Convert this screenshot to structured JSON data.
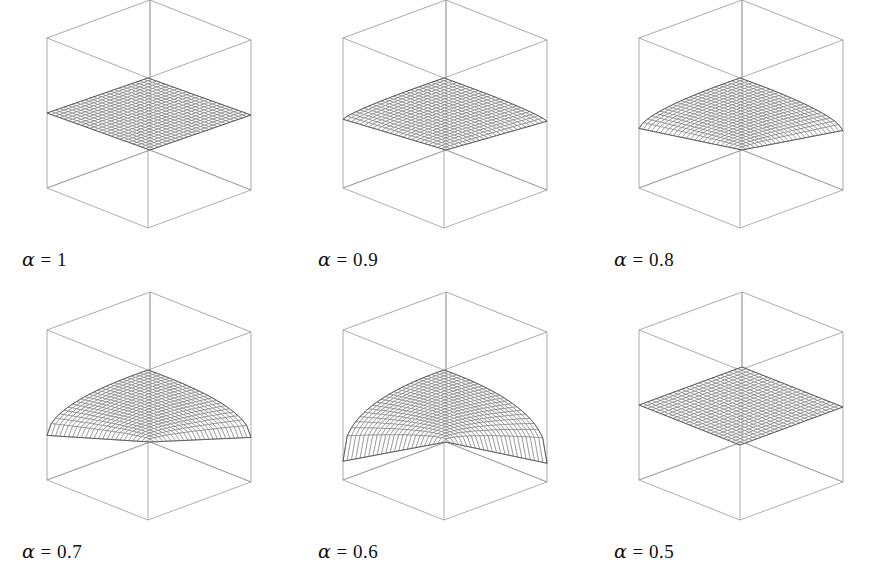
{
  "figure": {
    "title": "",
    "background": "#ffffff",
    "line_color": "#6f6f6f",
    "box_color": "#8a8a8a",
    "text_color": "#111111",
    "rows": 2,
    "cols": 3
  },
  "panels": [
    {
      "id": "panel-alpha-1",
      "alpha_symbol": "α",
      "equals": "=",
      "value": "1",
      "label": "α = 1"
    },
    {
      "id": "panel-alpha-0-9",
      "alpha_symbol": "α",
      "equals": "=",
      "value": "0.9",
      "label": "α = 0.9"
    },
    {
      "id": "panel-alpha-0-8",
      "alpha_symbol": "α",
      "equals": "=",
      "value": "0.8",
      "label": "α = 0.8"
    },
    {
      "id": "panel-alpha-0-7",
      "alpha_symbol": "α",
      "equals": "=",
      "value": "0.7",
      "label": "α = 0.7"
    },
    {
      "id": "panel-alpha-0-6",
      "alpha_symbol": "α",
      "equals": "=",
      "value": "0.6",
      "label": "α = 0.6"
    },
    {
      "id": "panel-alpha-0-5",
      "alpha_symbol": "α",
      "equals": "=",
      "value": "0.5",
      "label": "α = 0.5"
    }
  ],
  "chart_data": {
    "type": "line",
    "subtype": "3d-wireframe-surface-grid",
    "title": "",
    "xlabel": "",
    "ylabel": "",
    "zlabel": "",
    "grid": false,
    "legend": "none",
    "axis_ranges": {
      "x": [
        0,
        1
      ],
      "y": [
        0,
        1
      ],
      "z": [
        0,
        1
      ]
    },
    "mesh_resolution": {
      "nx": 24,
      "ny": 24
    },
    "surface_formula": "z = ((x^p + y^p)/2)^(1/p), p = (2*alpha - 1)/alpha",
    "panels": [
      {
        "label": "α = 1",
        "alpha": 1,
        "p": 1,
        "description": "pyramid / peaked tent surface, apex at centre back, value 1 at peak",
        "peak_z": 1.0,
        "corner_z": {
          "front": 0.0,
          "left": 0.5,
          "right": 0.5,
          "back": 1.0
        }
      },
      {
        "label": "α = 0.9",
        "alpha": 0.9,
        "p": 0.888888,
        "description": "rounded peak, sides slightly convex",
        "peak_z": 1.0,
        "corner_z": {
          "front": 0.0,
          "left": 0.5,
          "right": 0.5,
          "back": 1.0
        }
      },
      {
        "label": "α = 0.8",
        "alpha": 0.8,
        "p": 0.75,
        "description": "dome flattening at top, edges bulging outward",
        "peak_z": 1.0,
        "corner_z": {
          "front": 0.0,
          "left": 0.5,
          "right": 0.5,
          "back": 1.0
        }
      },
      {
        "label": "α = 0.7",
        "alpha": 0.7,
        "p": 0.571428,
        "description": "broad dome, near-vertical skirt at left and right corners",
        "peak_z": 1.0,
        "corner_z": {
          "front": 0.0,
          "left": 0.5,
          "right": 0.5,
          "back": 1.0
        }
      },
      {
        "label": "α = 0.6",
        "alpha": 0.6,
        "p": 0.333333,
        "description": "very broad flat-topped dome with steep vertical skirts",
        "peak_z": 1.0,
        "corner_z": {
          "front": 0.0,
          "left": 0.5,
          "right": 0.5,
          "back": 1.0
        }
      },
      {
        "label": "α = 0.5",
        "alpha": 0.5,
        "p": 0,
        "description": "completely flat horizontal plane at mid height",
        "peak_z": 0.5,
        "corner_z": {
          "front": 0.5,
          "left": 0.5,
          "right": 0.5,
          "back": 0.5
        }
      }
    ]
  }
}
